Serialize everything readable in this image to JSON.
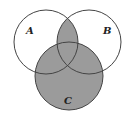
{
  "diagram": {
    "type": "venn",
    "sets": [
      {
        "label": "A",
        "cx": 46,
        "cy": 42,
        "r": 32
      },
      {
        "label": "B",
        "cx": 89,
        "cy": 42,
        "r": 32
      },
      {
        "label": "C",
        "cx": 69,
        "cy": 76,
        "r": 34
      }
    ],
    "shaded_regions": [
      "A∩B",
      "C"
    ],
    "colors": {
      "shade": "#9b9b9b",
      "stroke": "#444444",
      "background": "#ffffff"
    }
  }
}
